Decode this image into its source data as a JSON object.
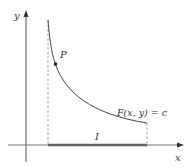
{
  "diagram": {
    "axes": {
      "x_label": "x",
      "y_label": "y"
    },
    "curve": {
      "label": "F(x, y) = c",
      "point_label": "P"
    },
    "interval": {
      "label": "I"
    },
    "colors": {
      "axis": "#555555",
      "curve": "#444444",
      "dashed": "#888888",
      "interval": "#666666",
      "text": "#333333"
    }
  }
}
